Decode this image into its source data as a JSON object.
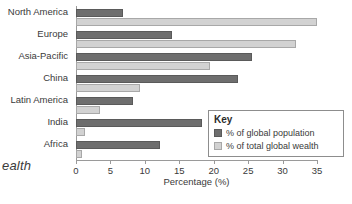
{
  "caption_fragment": "ealth",
  "legend": {
    "title": "Key",
    "entries": [
      {
        "label": "% of global population",
        "color": "#6e6e6e",
        "swatch": "dark-swatch-icon"
      },
      {
        "label": "% of total global wealth",
        "color": "#d2d2d2",
        "swatch": "light-swatch-icon"
      }
    ]
  },
  "chart_data": {
    "type": "bar",
    "orientation": "horizontal",
    "title": "",
    "xlabel": "Percentage (%)",
    "ylabel": "",
    "xlim": [
      0,
      35
    ],
    "xticks": [
      0,
      5,
      10,
      15,
      20,
      25,
      30,
      35
    ],
    "grid": false,
    "legend_position": "inside-bottom-right",
    "categories": [
      "North America",
      "Europe",
      "Asia-Pacific",
      "China",
      "Latin America",
      "India",
      "Africa"
    ],
    "series": [
      {
        "name": "% of global population",
        "color": "#6e6e6e",
        "values": [
          6.8,
          13.9,
          25.5,
          23.5,
          8.3,
          18.3,
          12.2
        ]
      },
      {
        "name": "% of total global wealth",
        "color": "#d2d2d2",
        "values": [
          35.0,
          31.9,
          19.5,
          9.3,
          3.5,
          1.3,
          0.9
        ]
      }
    ]
  }
}
